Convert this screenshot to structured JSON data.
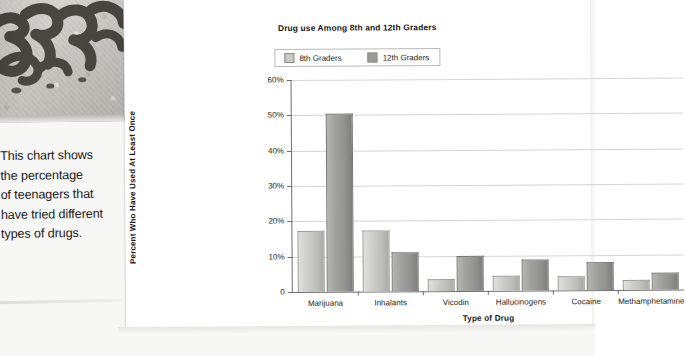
{
  "caption": {
    "lines": [
      "This chart shows",
      "the percentage",
      "of teenagers that",
      "have tried different",
      "types of drugs."
    ]
  },
  "photo": {
    "alt_name": "graffiti-wall-photo"
  },
  "chart_data": {
    "type": "bar",
    "title": "Drug use Among 8th and 12th Graders",
    "xlabel": "Type of Drug",
    "ylabel": "Percent Who Have Used At Least Once",
    "categories": [
      "Marijuana",
      "Inhalants",
      "Vicodin",
      "Hallucinogens",
      "Cocaine",
      "Methamphetamine"
    ],
    "series": [
      {
        "name": "8th Graders",
        "color": "#c8c8c5",
        "values": [
          17,
          17,
          3,
          4,
          3.7,
          2.5
        ]
      },
      {
        "name": "12th Graders",
        "color": "#9a9a98",
        "values": [
          50,
          10.7,
          9.7,
          8.6,
          7.7,
          4.5
        ]
      }
    ],
    "ylim": [
      0,
      60
    ],
    "yticks": [
      0,
      10,
      20,
      30,
      40,
      50,
      60
    ],
    "ytick_labels": [
      "0",
      "10%",
      "20%",
      "30%",
      "40%",
      "50%",
      "60%"
    ],
    "grid": true,
    "legend_position": "top-center"
  }
}
